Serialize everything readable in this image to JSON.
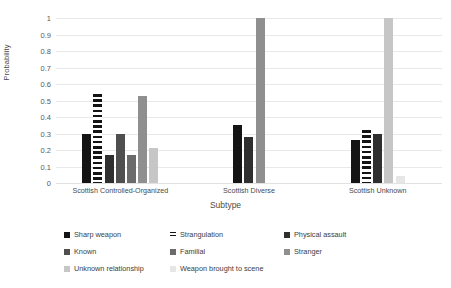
{
  "chart_data": {
    "type": "bar",
    "title": "",
    "xlabel": "Subtype",
    "ylabel": "Probability",
    "ylim": [
      0,
      1
    ],
    "yticks": [
      "1",
      "0.9",
      "0.8",
      "0.7",
      "0.6",
      "0.5",
      "0.4",
      "0.3",
      "0.2",
      "0.1",
      "0"
    ],
    "grid": true,
    "legend_position": "bottom",
    "categories": [
      "Scottish Controlled-Organized",
      "Scottish Diverse",
      "Scottish Unknown"
    ],
    "series": [
      {
        "name": "Sharp weapon",
        "color": "#141414",
        "pattern": "solid",
        "values": [
          0.3,
          0.35,
          0.26
        ]
      },
      {
        "name": "Strangulation",
        "color": "#141414",
        "pattern": "striped",
        "values": [
          0.54,
          null,
          0.32
        ]
      },
      {
        "name": "Physical assault",
        "color": "#2f2f2f",
        "pattern": "solid",
        "values": [
          0.17,
          0.28,
          0.3
        ]
      },
      {
        "name": "Known",
        "color": "#4f4f4f",
        "pattern": "solid",
        "values": [
          0.3,
          null,
          null
        ]
      },
      {
        "name": "Familial",
        "color": "#6b6b6b",
        "pattern": "solid",
        "values": [
          0.17,
          null,
          null
        ]
      },
      {
        "name": "Stranger",
        "color": "#8f8f8f",
        "pattern": "solid",
        "values": [
          0.53,
          1.0,
          null
        ]
      },
      {
        "name": "Unknown relationship",
        "color": "#c6c6c6",
        "pattern": "solid",
        "values": [
          0.21,
          null,
          1.0
        ]
      },
      {
        "name": "Weapon brought to scene",
        "color": "#e6e6e6",
        "pattern": "solid",
        "values": [
          null,
          null,
          0.04
        ]
      }
    ]
  },
  "legend": {
    "items": [
      {
        "label": "Sharp weapon"
      },
      {
        "label": "Strangulation"
      },
      {
        "label": "Physical assault"
      },
      {
        "label": "Known"
      },
      {
        "label": "Familial"
      },
      {
        "label": "Stranger"
      },
      {
        "label": "Unknown relationship"
      },
      {
        "label": "Weapon brought to scene"
      }
    ]
  }
}
